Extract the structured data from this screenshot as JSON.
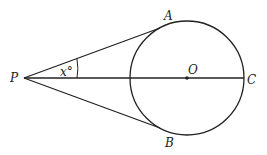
{
  "diagram": {
    "labels": {
      "P": "P",
      "A": "A",
      "B": "B",
      "O": "O",
      "C": "C",
      "angle": "x°"
    },
    "colors": {
      "stroke": "#222222",
      "background": "#ffffff"
    }
  }
}
